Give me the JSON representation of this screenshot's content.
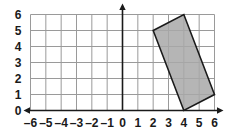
{
  "chart_data": {
    "type": "scatter",
    "title": "",
    "xlabel": "",
    "ylabel": "",
    "xlim": [
      -6,
      6
    ],
    "ylim": [
      0,
      6
    ],
    "grid": true,
    "legend": null,
    "x_tick_labels": [
      "–6",
      "–5",
      "–4",
      "–3",
      "–2",
      "–1",
      "0",
      "1",
      "2",
      "3",
      "4",
      "5",
      "6"
    ],
    "x_tick_values": [
      -6,
      -5,
      -4,
      -3,
      -2,
      -1,
      0,
      1,
      2,
      3,
      4,
      5,
      6
    ],
    "y_tick_labels": [
      "0",
      "1",
      "2",
      "3",
      "4",
      "5",
      "6"
    ],
    "y_tick_values": [
      0,
      1,
      2,
      3,
      4,
      5,
      6
    ],
    "shapes": [
      {
        "name": "shaded-rectangle",
        "kind": "polygon",
        "vertices": [
          [
            2,
            5
          ],
          [
            4,
            6
          ],
          [
            6,
            1
          ],
          [
            4,
            0
          ]
        ],
        "fill": "#a8a8a8",
        "fill_opacity": 0.85,
        "stroke": "#1a1a1a",
        "stroke_width": 1.6
      }
    ],
    "colors": {
      "grid_line": "#9a9a9a",
      "axis_line": "#1a1a1a",
      "plot_background": "#ffffff",
      "shape_fill": "#a8a8a8",
      "shape_stroke": "#1a1a1a",
      "tick_label": "#1a1a1a"
    }
  },
  "axes": {
    "x_axis_name": "x-axis",
    "y_axis_name": "y-axis"
  }
}
